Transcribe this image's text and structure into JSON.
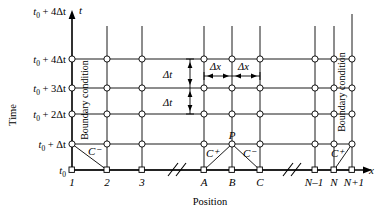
{
  "figure": {
    "axes": {
      "y_axis_symbol": "t",
      "y_axis_title": "Time",
      "x_axis_symbol": "x",
      "x_axis_title": "Position"
    },
    "time_ticks": [
      {
        "label": "t₀ + 4Δt",
        "sub": "0"
      },
      {
        "label": "t₀ + 4Δt",
        "sub": "0"
      },
      {
        "label": "t₀ + 3Δt",
        "sub": "0"
      },
      {
        "label": "t₀ + 2Δt",
        "sub": "0"
      },
      {
        "label": "t₀ + Δt",
        "sub": "0"
      },
      {
        "label": "t₀",
        "sub": "0"
      }
    ],
    "time_tick_parts": [
      {
        "base": "t",
        "sub": "0",
        "rest": " + 4Δt"
      },
      {
        "base": "t",
        "sub": "0",
        "rest": " + 4Δt"
      },
      {
        "base": "t",
        "sub": "0",
        "rest": " + 3Δt"
      },
      {
        "base": "t",
        "sub": "0",
        "rest": " + 2Δt"
      },
      {
        "base": "t",
        "sub": "0",
        "rest": " + Δt"
      },
      {
        "base": "t",
        "sub": "0",
        "rest": ""
      }
    ],
    "position_ticks": [
      "1",
      "2",
      "3",
      "A",
      "B",
      "C",
      "N–1",
      "N",
      "N+1"
    ],
    "step_labels": {
      "dt_upper": "Δt",
      "dt_lower": "Δt",
      "dx_left": "Δx",
      "dx_right": "Δx"
    },
    "boundary_left": "Boundary condition",
    "boundary_right": "Boundary condition",
    "characteristics": {
      "left_label": "C⁻",
      "center_plus": "C⁺",
      "center_minus": "C⁻",
      "right_label": "C⁺"
    },
    "points": {
      "p_label": "P"
    },
    "break_marks": 2,
    "colors": {
      "line": "#000000",
      "node_fill": "#ffffff",
      "background": "#ffffff"
    }
  }
}
